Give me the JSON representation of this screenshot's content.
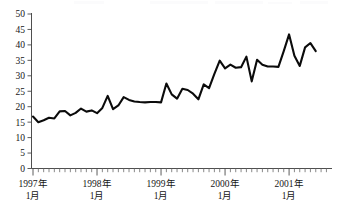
{
  "chart": {
    "type": "line",
    "title": "",
    "xlabel": "",
    "ylabel": "",
    "background_color": "#ffffff",
    "line_color": "#0b0b0b",
    "axis_color": "#3b3b3b",
    "grid": false,
    "legend": false
  },
  "axes": {
    "y": {
      "min": 0,
      "max": 50,
      "tick_step": 5,
      "tick_labels": [
        "0",
        "5",
        "10",
        "15",
        "20",
        "25",
        "30",
        "35",
        "40",
        "45",
        "50"
      ],
      "tick_values": [
        0,
        5,
        10,
        15,
        20,
        25,
        30,
        35,
        40,
        45,
        50
      ]
    },
    "x": {
      "major_tick_labels": [
        {
          "line1": "1997年",
          "line2": "1月",
          "index": 0
        },
        {
          "line1": "1998年",
          "line2": "1月",
          "index": 12
        },
        {
          "line1": "1999年",
          "line2": "1月",
          "index": 24
        },
        {
          "line1": "2000年",
          "line2": "1月",
          "index": 36
        },
        {
          "line1": "2001年",
          "line2": "1月",
          "index": 48
        }
      ],
      "minor_tick_interval_label": "1 month",
      "total_points": 54
    }
  },
  "chart_data": {
    "type": "line",
    "title": "",
    "xlabel": "",
    "ylabel": "",
    "ylim": [
      0,
      50
    ],
    "ytick_labels": [
      "0",
      "5",
      "10",
      "15",
      "20",
      "25",
      "30",
      "35",
      "40",
      "45",
      "50"
    ],
    "xtick_labels": [
      "1997年 1月",
      "1998年 1月",
      "1999年 1月",
      "2000年 1月",
      "2001年 1月"
    ],
    "grid": false,
    "legend": false,
    "categories": [
      "1997年1月",
      "1997年2月",
      "1997年3月",
      "1997年4月",
      "1997年5月",
      "1997年6月",
      "1997年7月",
      "1997年8月",
      "1997年9月",
      "1997年10月",
      "1997年11月",
      "1997年12月",
      "1998年1月",
      "1998年2月",
      "1998年3月",
      "1998年4月",
      "1998年5月",
      "1998年6月",
      "1998年7月",
      "1998年8月",
      "1998年9月",
      "1998年10月",
      "1998年11月",
      "1998年12月",
      "1999年1月",
      "1999年2月",
      "1999年3月",
      "1999年4月",
      "1999年5月",
      "1999年6月",
      "1999年7月",
      "1999年8月",
      "1999年9月",
      "1999年10月",
      "1999年11月",
      "1999年12月",
      "2000年1月",
      "2000年2月",
      "2000年3月",
      "2000年4月",
      "2000年5月",
      "2000年6月",
      "2000年7月",
      "2000年8月",
      "2000年9月",
      "2000年10月",
      "2000年11月",
      "2000年12月",
      "2001年1月",
      "2001年2月",
      "2001年3月",
      "2001年4月",
      "2001年5月",
      "2001年6月"
    ],
    "values": [
      16.8,
      15.0,
      15.6,
      16.4,
      16.2,
      18.5,
      18.6,
      17.2,
      18.0,
      19.4,
      18.4,
      18.8,
      17.9,
      19.6,
      23.5,
      19.2,
      20.4,
      23.1,
      22.2,
      21.7,
      21.5,
      21.4,
      21.5,
      21.5,
      21.4,
      27.5,
      24.0,
      22.6,
      25.8,
      25.4,
      24.2,
      22.4,
      27.2,
      26.0,
      30.6,
      34.9,
      32.4,
      33.6,
      32.6,
      32.8,
      36.2,
      28.2,
      35.2,
      33.6,
      33.0,
      33.0,
      32.9,
      38.0,
      43.4,
      36.5,
      33.2,
      39.2,
      40.6,
      38.0
    ],
    "series": [
      {
        "name": "series-1",
        "color": "#0b0b0b",
        "values": [
          16.8,
          15.0,
          15.6,
          16.4,
          16.2,
          18.5,
          18.6,
          17.2,
          18.0,
          19.4,
          18.4,
          18.8,
          17.9,
          19.6,
          23.5,
          19.2,
          20.4,
          23.1,
          22.2,
          21.7,
          21.5,
          21.4,
          21.5,
          21.5,
          21.4,
          27.5,
          24.0,
          22.6,
          25.8,
          25.4,
          24.2,
          22.4,
          27.2,
          26.0,
          30.6,
          34.9,
          32.4,
          33.6,
          32.6,
          32.8,
          36.2,
          28.2,
          35.2,
          33.6,
          33.0,
          33.0,
          32.9,
          38.0,
          43.4,
          36.5,
          33.2,
          39.2,
          40.6,
          38.0
        ]
      }
    ]
  }
}
